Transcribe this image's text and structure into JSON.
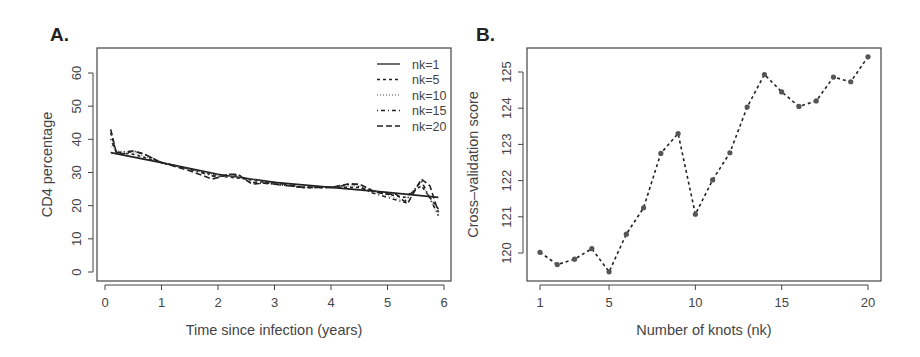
{
  "panels": {
    "a": {
      "label": "A."
    },
    "b": {
      "label": "B."
    }
  },
  "chart_data": [
    {
      "type": "line",
      "panel": "A.",
      "title": "",
      "xlabel": "Time since infection (years)",
      "ylabel": "CD4 percentage",
      "xlim": [
        0,
        6
      ],
      "ylim": [
        0,
        65
      ],
      "xticks": [
        0,
        1,
        2,
        3,
        4,
        5,
        6
      ],
      "yticks": [
        0,
        10,
        20,
        30,
        40,
        50,
        60
      ],
      "grid": false,
      "legend_position": "top-right",
      "legend": [
        {
          "label": "nk=1",
          "style": "solid"
        },
        {
          "label": "nk=5",
          "style": "dashed-short"
        },
        {
          "label": "nk=10",
          "style": "dotted"
        },
        {
          "label": "nk=15",
          "style": "dash-dot"
        },
        {
          "label": "nk=20",
          "style": "dashed-long"
        }
      ],
      "series": [
        {
          "name": "nk=1",
          "x": [
            0.1,
            1,
            2,
            3,
            4,
            5,
            5.9
          ],
          "values": [
            36,
            33,
            29.5,
            27,
            25.5,
            24,
            22.5
          ]
        },
        {
          "name": "nk=5",
          "x": [
            0.1,
            0.2,
            0.5,
            1,
            1.5,
            2,
            2.5,
            3,
            3.5,
            4,
            4.5,
            5,
            5.3,
            5.6,
            5.9
          ],
          "values": [
            42,
            36,
            35.5,
            33,
            31,
            29,
            28,
            26.5,
            25.5,
            25.5,
            25.5,
            23.5,
            22.5,
            26,
            19
          ]
        },
        {
          "name": "nk=10",
          "x": [
            0.1,
            0.2,
            0.5,
            1,
            1.5,
            2,
            2.5,
            3,
            3.5,
            4,
            4.5,
            5,
            5.3,
            5.6,
            5.9
          ],
          "values": [
            38,
            36.5,
            36,
            33,
            31,
            29,
            28.5,
            26.5,
            25.5,
            25.5,
            26,
            23,
            21.5,
            27,
            17
          ]
        },
        {
          "name": "nk=15",
          "x": [
            0.1,
            0.2,
            0.5,
            0.7,
            1,
            1.5,
            2,
            2.2,
            2.4,
            2.6,
            3,
            3.5,
            4,
            4.4,
            4.7,
            5,
            5.3,
            5.6,
            5.9
          ],
          "values": [
            40,
            36,
            36.5,
            35.5,
            33,
            31,
            28.5,
            29.5,
            29,
            27,
            26.5,
            25.5,
            25.5,
            26.5,
            24,
            22.5,
            21,
            27.5,
            17
          ]
        },
        {
          "name": "nk=20",
          "x": [
            0.1,
            0.2,
            0.3,
            0.5,
            0.7,
            1,
            1.5,
            1.9,
            2.2,
            2.35,
            2.6,
            3,
            3.5,
            4,
            4.3,
            4.5,
            4.8,
            5,
            5.15,
            5.35,
            5.6,
            5.75,
            5.9
          ],
          "values": [
            43,
            36,
            35.5,
            36.5,
            35.5,
            33,
            30.5,
            28,
            29.5,
            29.5,
            26.5,
            27,
            25.5,
            25.5,
            26.5,
            26.5,
            24,
            23.5,
            23.5,
            20.5,
            28,
            26,
            18
          ]
        }
      ]
    },
    {
      "type": "line",
      "panel": "B.",
      "title": "",
      "xlabel": "Number of knots (nk)",
      "ylabel": "Cross–validation score",
      "xlim": [
        1,
        20
      ],
      "ylim": [
        119.5,
        125.5
      ],
      "xticks": [
        1,
        5,
        10,
        15,
        20
      ],
      "yticks": [
        120,
        121,
        122,
        123,
        124,
        125
      ],
      "grid": false,
      "marker": "circle",
      "line_style": "dashed",
      "series": [
        {
          "name": "CV score",
          "x": [
            1,
            2,
            3,
            4,
            5,
            6,
            7,
            8,
            9,
            10,
            11,
            12,
            13,
            14,
            15,
            16,
            17,
            18,
            19,
            20
          ],
          "values": [
            120.02,
            119.68,
            119.83,
            120.12,
            119.48,
            120.52,
            121.25,
            122.75,
            123.3,
            121.07,
            122.02,
            122.77,
            124.03,
            124.93,
            124.45,
            124.05,
            124.2,
            124.86,
            124.73,
            125.42
          ]
        }
      ]
    }
  ]
}
